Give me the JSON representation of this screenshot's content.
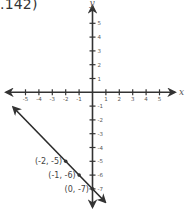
{
  "caption": ".142)",
  "chart_data": {
    "type": "line",
    "title": "",
    "xlabel": "x",
    "ylabel": "y",
    "xlim": [
      -5,
      5
    ],
    "ylim": [
      -7,
      5
    ],
    "x_ticks": [
      -5,
      -4,
      -3,
      -2,
      -1,
      1,
      2,
      3,
      4,
      5
    ],
    "y_ticks": [
      5,
      4,
      3,
      2,
      1,
      -1,
      -2,
      -3,
      -4,
      -5,
      -6,
      -7
    ],
    "grid": false,
    "series": [
      {
        "name": "line",
        "equation": "y = -x - 7",
        "points": [
          {
            "x": -2,
            "y": -5,
            "label": "(-2, -5)"
          },
          {
            "x": -1,
            "y": -6,
            "label": "(-1, -6)"
          },
          {
            "x": 0,
            "y": -7,
            "label": "(0, -7)"
          }
        ],
        "arrows": "both",
        "color": "#2b2b2b"
      }
    ]
  },
  "colors": {
    "axis": "#333333",
    "line": "#2b2b2b",
    "text": "#555555"
  }
}
